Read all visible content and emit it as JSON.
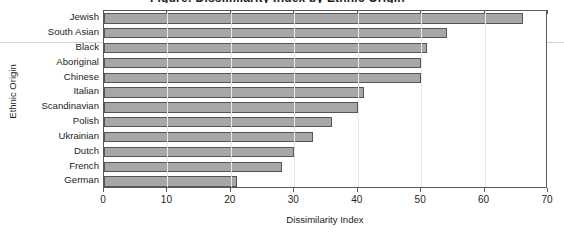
{
  "figure": {
    "title_fragment": "Figure: Dissimilarity Index by Ethnic Origin",
    "y_axis_title": "Ethnic Origin",
    "x_axis_title": "Dissimilarity Index",
    "bar_fill_color": "#a7a7a7",
    "bar_border_color": "#555555",
    "axis_color": "#58595b",
    "gridline_color": "#e9e9e9"
  },
  "chart_data": {
    "type": "bar",
    "orientation": "horizontal",
    "title": "",
    "xlabel": "Dissimilarity Index",
    "ylabel": "Ethnic Origin",
    "xlim": [
      0,
      70
    ],
    "xticks": [
      0,
      10,
      20,
      30,
      40,
      50,
      60,
      70
    ],
    "xticklabels": [
      "0",
      "10",
      "20",
      "30",
      "40",
      "50",
      "60",
      "70"
    ],
    "grid": "vertical",
    "legend": "none",
    "categories": [
      "Jewish",
      "South Asian",
      "Black",
      "Aboriginal",
      "Chinese",
      "Italian",
      "Scandinavian",
      "Polish",
      "Ukrainian",
      "Dutch",
      "French",
      "German"
    ],
    "values": [
      66,
      54,
      51,
      50,
      50,
      41,
      40,
      36,
      33,
      30,
      28,
      21
    ]
  }
}
